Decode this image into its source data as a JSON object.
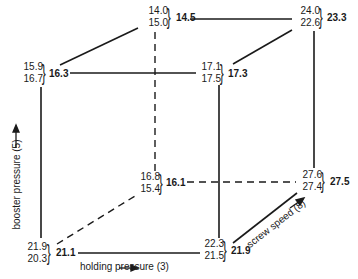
{
  "diagram": {
    "type": "cube-factorial-design",
    "axes": {
      "x": {
        "label": "holding pressure (3)"
      },
      "y": {
        "label": "booster pressure (5)"
      },
      "z": {
        "label": "screw speed (8)"
      }
    },
    "corners": {
      "top_back_left": {
        "v1": "14.0",
        "v2": "15.0",
        "avg": "14.5"
      },
      "top_back_right": {
        "v1": "24.0",
        "v2": "22.6",
        "avg": "23.3"
      },
      "top_front_left": {
        "v1": "15.9",
        "v2": "16.7",
        "avg": "16.3"
      },
      "top_front_right": {
        "v1": "17.1",
        "v2": "17.5",
        "avg": "17.3"
      },
      "bottom_back_left": {
        "v1": "16.8",
        "v2": "15.4",
        "avg": "16.1"
      },
      "bottom_back_right": {
        "v1": "27.6",
        "v2": "27.4",
        "avg": "27.5"
      },
      "bottom_front_left": {
        "v1": "21.9",
        "v2": "20.3",
        "avg": "21.1"
      },
      "bottom_front_right": {
        "v1": "22.3",
        "v2": "21.5",
        "avg": "21.9"
      }
    },
    "brace": "}",
    "line_color": "#1a1a1a"
  }
}
